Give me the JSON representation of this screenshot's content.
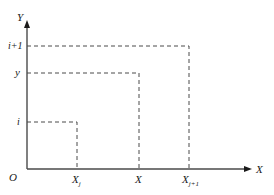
{
  "diagram": {
    "axes": {
      "x_label": "X",
      "y_label": "Y",
      "origin_label": "O"
    },
    "y_ticks": [
      {
        "id": "i-plus-1",
        "label": "i+1"
      },
      {
        "id": "y",
        "label": "y"
      },
      {
        "id": "i",
        "label": "i"
      }
    ],
    "x_ticks": [
      {
        "id": "xj",
        "label": "X",
        "subscript": "j"
      },
      {
        "id": "x",
        "label": "X",
        "subscript": ""
      },
      {
        "id": "xj1",
        "label": "X",
        "subscript": "j+1"
      }
    ],
    "rectangles": [
      {
        "from_x_tick": "xj",
        "from_y_tick": "i"
      },
      {
        "from_x_tick": "x",
        "from_y_tick": "y"
      },
      {
        "from_x_tick": "xj1",
        "from_y_tick": "i-plus-1"
      }
    ],
    "colors": {
      "line": "#4a4a4a",
      "text": "#1a1a1a",
      "background": "#ffffff"
    }
  }
}
